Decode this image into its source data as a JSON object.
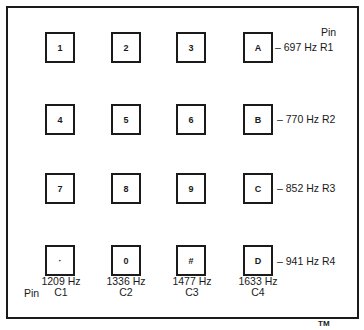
{
  "diagram": {
    "keys": [
      [
        "1",
        "2",
        "3",
        "A"
      ],
      [
        "4",
        "5",
        "6",
        "B"
      ],
      [
        "7",
        "8",
        "9",
        "C"
      ],
      [
        "·",
        "0",
        "#",
        "D"
      ]
    ],
    "rows": [
      {
        "label": "– 697 Hz R1"
      },
      {
        "label": "– 770 Hz R2"
      },
      {
        "label": "– 852 Hz R3"
      },
      {
        "label": "– 941 Hz R4"
      }
    ],
    "columns": [
      {
        "freq": "1209 Hz",
        "pin": "C1"
      },
      {
        "freq": "1336 Hz",
        "pin": "C2"
      },
      {
        "freq": "1477 Hz",
        "pin": "C3"
      },
      {
        "freq": "1633 Hz",
        "pin": "C4"
      }
    ],
    "row_pin_header": "Pin",
    "col_pin_header": "Pin",
    "trademark": "TM"
  }
}
